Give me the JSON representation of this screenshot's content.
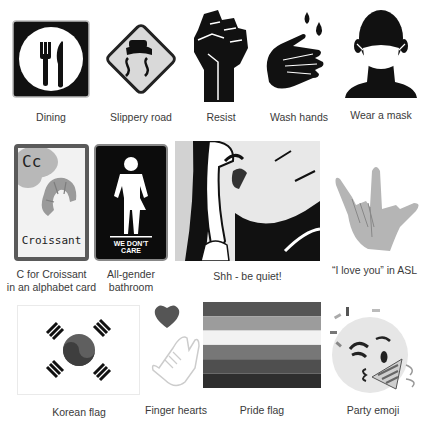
{
  "items": [
    {
      "id": "dining",
      "caption": "Dining",
      "icon": "dining-sign-icon"
    },
    {
      "id": "slippery-road",
      "caption": "Slippery road",
      "icon": "slippery-road-sign-icon"
    },
    {
      "id": "resist",
      "caption": "Resist",
      "icon": "raised-fist-icon"
    },
    {
      "id": "wash-hands",
      "caption": "Wash hands",
      "icon": "wash-hands-icon"
    },
    {
      "id": "wear-a-mask",
      "caption": "Wear a mask",
      "icon": "face-mask-icon"
    },
    {
      "id": "croissant-card",
      "caption_line1": "C for Croissant",
      "caption_line2": "in an alphabet card",
      "card_letter": "Cc",
      "card_word": "Croissant",
      "icon": "alphabet-card-icon"
    },
    {
      "id": "all-gender-bathroom",
      "caption_line1": "All-gender",
      "caption_line2": "bathroom",
      "sign_text_line1": "WE DON'T",
      "sign_text_line2": "CARE",
      "icon": "all-gender-bathroom-sign-icon"
    },
    {
      "id": "shh",
      "caption": "Shh - be quiet!",
      "icon": "shh-illustration-icon"
    },
    {
      "id": "asl-love",
      "caption": "“I love you” in ASL",
      "icon": "asl-i-love-you-hand-icon"
    },
    {
      "id": "korean-flag",
      "caption": "Korean flag",
      "icon": "korean-flag-icon"
    },
    {
      "id": "finger-hearts",
      "caption": "Finger hearts",
      "icon": "finger-heart-icon"
    },
    {
      "id": "pride-flag",
      "caption": "Pride flag",
      "icon": "pride-flag-icon"
    },
    {
      "id": "party-emoji",
      "caption": "Party emoji",
      "icon": "party-face-emoji-icon"
    }
  ],
  "colors": {
    "black": "#111111",
    "sign_gray": "#d6d6d6",
    "hand_gray": "#b5b5b5",
    "card_border": "#5a5a5a",
    "croissant": "#9a9a9a",
    "pride_stripes": [
      "#555555",
      "#9c9c9c",
      "#f2f2f2",
      "#777777",
      "#4f4f4f",
      "#2e2e2e"
    ]
  }
}
